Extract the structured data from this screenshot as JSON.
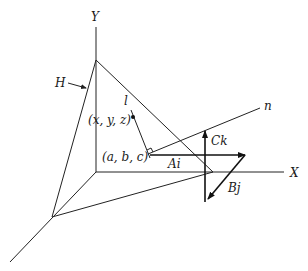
{
  "figure": {
    "type": "3d-geometry-diagram",
    "axes": {
      "y_label": "Y",
      "x_label": "X"
    },
    "plane_label": "H",
    "line_label": "l",
    "normal_label": "n",
    "point_general": "(x, y, z)",
    "point_foot": "(a, b, c)",
    "vectors": {
      "i_component": "Ai",
      "j_component": "Bj",
      "k_component": "Ck"
    },
    "colors": {
      "ink": "#222222",
      "background": "#ffffff"
    }
  }
}
